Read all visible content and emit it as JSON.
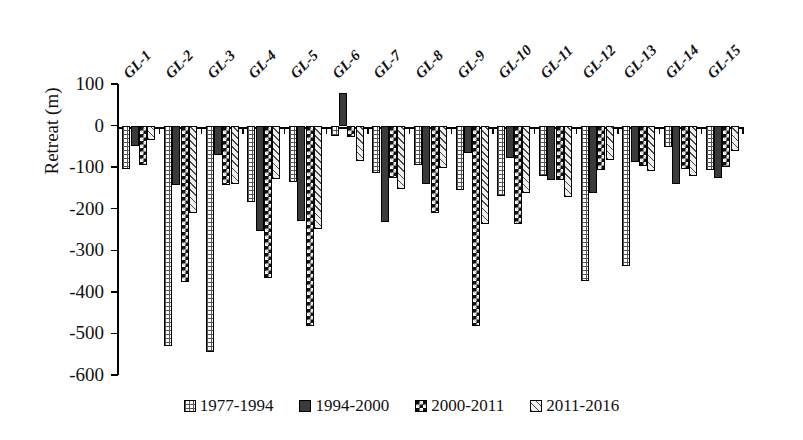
{
  "chart_data": {
    "type": "bar",
    "title": "",
    "xlabel": "",
    "ylabel": "Retreat (m)",
    "ylim": [
      -600,
      100
    ],
    "ytick_labels": [
      "100",
      "0",
      "-100",
      "-200",
      "-300",
      "-400",
      "-500",
      "-600"
    ],
    "ytick_values": [
      100,
      0,
      -100,
      -200,
      -300,
      -400,
      -500,
      -600
    ],
    "grid": false,
    "legend_position": "bottom",
    "categories": [
      "GL-1",
      "GL-2",
      "GL-3",
      "GL-4",
      "GL-5",
      "GL-6",
      "GL-7",
      "GL-8",
      "GL-9",
      "GL-10",
      "GL-11",
      "GL-12",
      "GL-13",
      "GL-14",
      "GL-15"
    ],
    "series": [
      {
        "name": "1977-1994",
        "pattern": "dots",
        "values": [
          -105,
          -531,
          -545,
          -183,
          -136,
          -25,
          -113,
          -95,
          -155,
          -170,
          -122,
          -374,
          -338,
          -52,
          -107
        ]
      },
      {
        "name": "1994-2000",
        "pattern": "solid",
        "values": [
          -48,
          -144,
          -71,
          -253,
          -230,
          78,
          -232,
          -140,
          -67,
          -77,
          -130,
          -162,
          -88,
          -141,
          -126
        ]
      },
      {
        "name": "2000-2011",
        "pattern": "checker",
        "values": [
          -95,
          -377,
          -144,
          -367,
          -483,
          -27,
          -125,
          -210,
          -482,
          -237,
          -132,
          -107,
          -98,
          -105,
          -100
        ]
      },
      {
        "name": "2011-2016",
        "pattern": "diagonal",
        "values": [
          -35,
          -210,
          -141,
          -129,
          -250,
          -85,
          -153,
          -103,
          -237,
          -163,
          -171,
          -84,
          -109,
          -122,
          -60
        ]
      }
    ]
  },
  "legend": {
    "items": [
      {
        "label": "1977-1994"
      },
      {
        "label": "1994-2000"
      },
      {
        "label": "2000-2011"
      },
      {
        "label": "2011-2016"
      }
    ]
  },
  "axis": {
    "y_title": "Retreat (m)"
  }
}
